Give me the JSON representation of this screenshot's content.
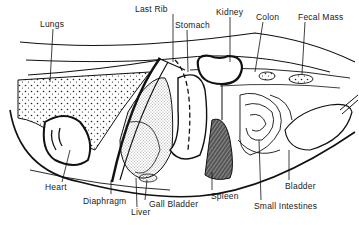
{
  "diagram": {
    "labels": [
      {
        "id": "lungs",
        "text": "Lungs",
        "x": 40,
        "y": 19
      },
      {
        "id": "last-rib",
        "text": "Last Rib",
        "x": 135,
        "y": 4
      },
      {
        "id": "stomach",
        "text": "Stomach",
        "x": 180,
        "y": 20
      },
      {
        "id": "kidney",
        "text": "Kidney",
        "x": 216,
        "y": 7
      },
      {
        "id": "colon",
        "text": "Colon",
        "x": 256,
        "y": 13
      },
      {
        "id": "fecal-mass",
        "text": "Fecal Mass",
        "x": 300,
        "y": 13
      },
      {
        "id": "heart",
        "text": "Heart",
        "x": 45,
        "y": 185
      },
      {
        "id": "diaphragm",
        "text": "Diaphragm",
        "x": 83,
        "y": 198
      },
      {
        "id": "liver",
        "text": "Liver",
        "x": 131,
        "y": 209
      },
      {
        "id": "gall-bladder",
        "text": "Gall Bladder",
        "x": 149,
        "y": 201
      },
      {
        "id": "spleen",
        "text": "Spleen",
        "x": 212,
        "y": 193
      },
      {
        "id": "small-intestines",
        "text": "Small Intestines",
        "x": 255,
        "y": 203
      },
      {
        "id": "bladder",
        "text": "Bladder",
        "x": 286,
        "y": 183
      }
    ]
  }
}
